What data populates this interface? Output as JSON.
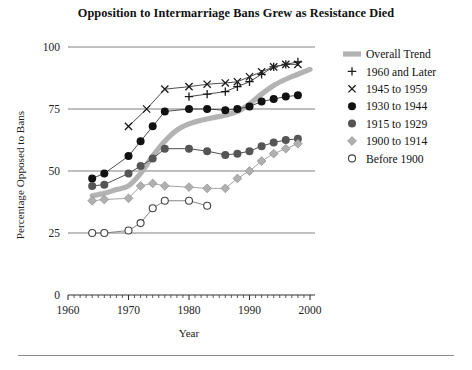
{
  "figure": {
    "title": "Opposition to Intermarriage Bans Grew as Resistance Died",
    "bottom_rule": "",
    "colors": {
      "trend": "#b3b3b3",
      "plus": "#1a1a1a",
      "cross": "#1a1a1a",
      "filled_black": "#111111",
      "dark_gray": "#555555",
      "light_diamond": "#b0b0b0",
      "open_circle": "#ffffff",
      "open_circle_stroke": "#444444",
      "gridline": "#808080",
      "axis": "#333333",
      "text": "#1a1a1a",
      "background": "#ffffff"
    }
  },
  "axes": {
    "y": {
      "label": "Percentage Opposed to Bans",
      "ticks": [
        "0",
        "25",
        "50",
        "75",
        "100"
      ],
      "tick_values": [
        0,
        25,
        50,
        75,
        100
      ],
      "min": 0,
      "max": 100
    },
    "x": {
      "label": "Year",
      "ticks": [
        "1960",
        "1970",
        "1980",
        "1990",
        "2000"
      ],
      "tick_values": [
        1960,
        1970,
        1980,
        1990,
        2000
      ],
      "min": 1960,
      "max": 2000,
      "minor_tick_step": 1
    }
  },
  "legend": {
    "entries": [
      {
        "label": "Overall Trend",
        "marker": "thick-line-icon"
      },
      {
        "label": "1960 and Later",
        "marker": "plus-marker-icon"
      },
      {
        "label": "1945 to 1959",
        "marker": "cross-marker-icon"
      },
      {
        "label": "1930 to 1944",
        "marker": "black-circle-marker-icon"
      },
      {
        "label": "1915 to 1929",
        "marker": "gray-circle-marker-icon"
      },
      {
        "label": "1900 to 1914",
        "marker": "light-diamond-marker-icon"
      },
      {
        "label": "Before 1900",
        "marker": "open-circle-marker-icon"
      }
    ]
  },
  "chart_data": {
    "type": "line",
    "title": "Opposition to Intermarriage Bans Grew as Resistance Died",
    "xlabel": "Year",
    "ylabel": "Percentage Opposed to Bans",
    "xlim": [
      1960,
      2000
    ],
    "ylim": [
      0,
      100
    ],
    "grid": true,
    "grid_axis": "y",
    "legend_position": "right",
    "series": [
      {
        "name": "Overall Trend",
        "style": "thick-smooth-band",
        "color": "#b3b3b3",
        "x": [
          1964,
          1966,
          1968,
          1970,
          1972,
          1974,
          1976,
          1978,
          1980,
          1982,
          1984,
          1986,
          1988,
          1990,
          1992,
          1994,
          1996,
          1998,
          2000
        ],
        "y": [
          40,
          41,
          42.5,
          44,
          49,
          56,
          62,
          66.5,
          69,
          70.5,
          71.5,
          72.5,
          74,
          77,
          81,
          84.5,
          87,
          89,
          91
        ]
      },
      {
        "name": "1960 and Later",
        "style": "plus",
        "color": "#1a1a1a",
        "x": [
          1980,
          1983,
          1986,
          1988,
          1990,
          1992,
          1994,
          1996,
          1998
        ],
        "y": [
          80,
          81,
          82,
          84,
          86,
          89,
          92,
          93,
          94
        ]
      },
      {
        "name": "1945 to 1959",
        "style": "cross",
        "color": "#1a1a1a",
        "x": [
          1970,
          1973,
          1976,
          1980,
          1983,
          1986,
          1988,
          1990,
          1992,
          1994,
          1996,
          1998
        ],
        "y": [
          68,
          75,
          83,
          84,
          85,
          85.5,
          86,
          88,
          90,
          92,
          93,
          93
        ]
      },
      {
        "name": "1930 to 1944",
        "style": "filled-circle-black",
        "color": "#111111",
        "x": [
          1964,
          1966,
          1970,
          1972,
          1974,
          1976,
          1980,
          1983,
          1986,
          1988,
          1990,
          1992,
          1994,
          1996,
          1998
        ],
        "y": [
          47,
          49,
          56,
          62,
          68,
          74,
          75,
          75,
          74.5,
          75,
          76,
          78,
          79,
          80,
          80.5
        ]
      },
      {
        "name": "1915 to 1929",
        "style": "filled-circle-gray",
        "color": "#555555",
        "x": [
          1964,
          1966,
          1970,
          1972,
          1974,
          1976,
          1980,
          1983,
          1986,
          1988,
          1990,
          1992,
          1994,
          1996,
          1998
        ],
        "y": [
          44,
          44.5,
          49,
          52,
          55,
          59,
          59,
          58,
          56.5,
          57,
          58,
          60,
          61.5,
          62.5,
          63
        ]
      },
      {
        "name": "1900 to 1914",
        "style": "diamond-light",
        "color": "#b0b0b0",
        "x": [
          1964,
          1966,
          1970,
          1972,
          1974,
          1976,
          1980,
          1983,
          1986,
          1988,
          1990,
          1992,
          1994,
          1996,
          1998
        ],
        "y": [
          38,
          38.5,
          39,
          44,
          45,
          44,
          43.5,
          43,
          43,
          47,
          50,
          54,
          57,
          59,
          61
        ]
      },
      {
        "name": "Before 1900",
        "style": "open-circle",
        "color": "#ffffff",
        "x": [
          1964,
          1966,
          1970,
          1972,
          1974,
          1976,
          1980,
          1983
        ],
        "y": [
          25,
          25,
          26,
          29,
          35,
          38,
          38,
          36
        ]
      }
    ]
  }
}
